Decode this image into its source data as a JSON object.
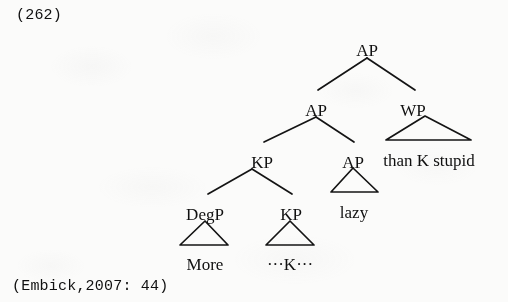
{
  "example_number": "(262)",
  "citation": "(Embick,2007: 44)",
  "tree": {
    "nodes": [
      {
        "id": "ap-root",
        "label": "AP",
        "x": 367,
        "y": 42
      },
      {
        "id": "ap-left",
        "label": "AP",
        "x": 316,
        "y": 102
      },
      {
        "id": "wp",
        "label": "WP",
        "x": 413,
        "y": 102
      },
      {
        "id": "kp-upper",
        "label": "KP",
        "x": 262,
        "y": 154
      },
      {
        "id": "ap-lower",
        "label": "AP",
        "x": 353,
        "y": 154
      },
      {
        "id": "degp",
        "label": "DegP",
        "x": 205,
        "y": 206
      },
      {
        "id": "kp-lower",
        "label": "KP",
        "x": 291,
        "y": 206
      }
    ],
    "leaves": [
      {
        "id": "wp-leaf",
        "label": "than K  stupid",
        "x": 429,
        "y": 152
      },
      {
        "id": "ap-leaf",
        "label": "lazy",
        "x": 354,
        "y": 204
      },
      {
        "id": "degp-leaf",
        "label": "More",
        "x": 205,
        "y": 256
      },
      {
        "id": "kp-leaf",
        "label": "···K···",
        "x": 290,
        "y": 256
      }
    ],
    "branches": [
      {
        "id": "ap-root-to-ap-left",
        "x1": 367,
        "y1": 58,
        "x2": 318,
        "y2": 90
      },
      {
        "id": "ap-root-to-wp",
        "x1": 367,
        "y1": 58,
        "x2": 415,
        "y2": 90
      },
      {
        "id": "ap-left-to-kp",
        "x1": 316,
        "y1": 117,
        "x2": 264,
        "y2": 142
      },
      {
        "id": "ap-left-to-ap",
        "x1": 316,
        "y1": 117,
        "x2": 354,
        "y2": 142
      },
      {
        "id": "kp-to-degp",
        "x1": 252,
        "y1": 169,
        "x2": 208,
        "y2": 194
      },
      {
        "id": "kp-to-kp",
        "x1": 252,
        "y1": 169,
        "x2": 292,
        "y2": 194
      }
    ],
    "triangles": [
      {
        "id": "wp-triangle",
        "apex_x": 425,
        "apex_y": 116,
        "left_x": 386,
        "right_x": 471,
        "base_y": 140
      },
      {
        "id": "ap-triangle",
        "apex_x": 353,
        "apex_y": 168,
        "left_x": 331,
        "right_x": 378,
        "base_y": 192
      },
      {
        "id": "degp-triangle",
        "apex_x": 205,
        "apex_y": 221,
        "left_x": 180,
        "right_x": 228,
        "base_y": 245
      },
      {
        "id": "kp-triangle",
        "apex_x": 290,
        "apex_y": 221,
        "left_x": 266,
        "right_x": 314,
        "base_y": 245
      }
    ]
  }
}
